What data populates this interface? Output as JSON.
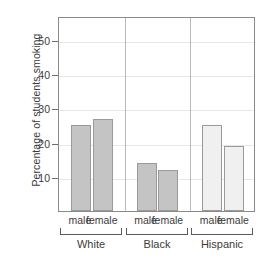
{
  "chart_data": {
    "type": "bar",
    "title": "",
    "xlabel": "",
    "ylabel": "Percentage of students smoking",
    "ylim": [
      0,
      57
    ],
    "yticks": [
      10,
      20,
      30,
      40,
      50
    ],
    "ytick_labels": [
      "10",
      "20",
      "30",
      "40",
      "50"
    ],
    "grid": "horizontal",
    "legend": "none",
    "panels": [
      {
        "group": "White",
        "categories": [
          "male",
          "female"
        ],
        "values": [
          25,
          27
        ],
        "bar_color": "#c4c4c4",
        "bar_border": "#9a9a9a"
      },
      {
        "group": "Black",
        "categories": [
          "male",
          "female"
        ],
        "values": [
          14,
          12
        ],
        "bar_color": "#c4c4c4",
        "bar_border": "#9a9a9a"
      },
      {
        "group": "Hispanic",
        "categories": [
          "male",
          "female"
        ],
        "values": [
          25,
          19
        ],
        "bar_color": "#f0f0f0",
        "bar_border": "#9a9a9a"
      }
    ],
    "categories_flat": [
      "male",
      "female",
      "male",
      "female",
      "male",
      "female"
    ],
    "values_flat": [
      25,
      27,
      14,
      12,
      25,
      19
    ],
    "groups": [
      "White",
      "Black",
      "Hispanic"
    ]
  },
  "axis": {
    "y_title": "Percentage of students smoking"
  },
  "colors": {
    "bar_dark": "#c4c4c4",
    "bar_light": "#f0f0f0",
    "bar_border": "#9a9a9a",
    "gridline": "#e6e6e6",
    "panel_border": "#8a8a8a",
    "text": "#3c3c3c"
  }
}
